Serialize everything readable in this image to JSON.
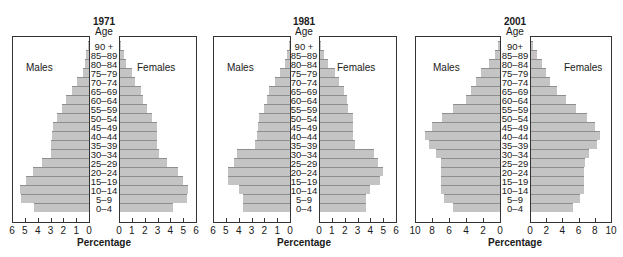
{
  "chart_data": [
    {
      "type": "bar",
      "subtype": "population-pyramid",
      "title": "1971",
      "age_header": "Age",
      "categories": [
        "0–4",
        "5–9",
        "10–14",
        "15–19",
        "20–24",
        "25–29",
        "30–34",
        "35–39",
        "40–44",
        "45–49",
        "50–54",
        "55–59",
        "60–64",
        "65–69",
        "70–74",
        "75–79",
        "80–84",
        "85–89",
        "90 +"
      ],
      "series": [
        {
          "name": "Males",
          "values": [
            4.3,
            5.3,
            5.4,
            4.9,
            4.4,
            3.7,
            3.0,
            3.0,
            2.9,
            2.8,
            2.5,
            2.1,
            1.8,
            1.3,
            0.9,
            0.5,
            0.3,
            0.2,
            0.05
          ]
        },
        {
          "name": "Females",
          "values": [
            4.1,
            5.2,
            5.3,
            4.9,
            4.5,
            3.7,
            3.0,
            2.9,
            2.9,
            2.9,
            2.5,
            2.1,
            1.8,
            1.6,
            1.2,
            0.9,
            0.5,
            0.3,
            0.1
          ]
        }
      ],
      "xlabel": "Percentage",
      "xlim": [
        0,
        6
      ],
      "ticks": [
        "0",
        "1",
        "2",
        "3",
        "4",
        "5",
        "6"
      ],
      "grid": false
    },
    {
      "type": "bar",
      "subtype": "population-pyramid",
      "title": "1981",
      "age_header": "Age",
      "categories": [
        "0–4",
        "5–9",
        "10–14",
        "15–19",
        "20–24",
        "25–29",
        "30–34",
        "35–39",
        "40–44",
        "45–49",
        "50–54",
        "55–59",
        "60–64",
        "65–69",
        "70–74",
        "75–79",
        "80–84",
        "85–89",
        "90 +"
      ],
      "series": [
        {
          "name": "Males",
          "values": [
            3.7,
            3.7,
            4.0,
            4.8,
            4.8,
            4.4,
            4.1,
            2.7,
            2.6,
            2.5,
            2.4,
            2.0,
            1.8,
            1.6,
            1.2,
            0.8,
            0.4,
            0.2,
            0.05
          ]
        },
        {
          "name": "Females",
          "values": [
            3.6,
            3.6,
            3.9,
            4.7,
            4.9,
            4.5,
            4.2,
            2.7,
            2.6,
            2.6,
            2.6,
            2.2,
            2.1,
            1.9,
            1.5,
            1.2,
            0.6,
            0.3,
            0.1
          ]
        }
      ],
      "xlabel": "Percentage",
      "xlim": [
        0,
        6
      ],
      "ticks": [
        "0",
        "1",
        "2",
        "3",
        "4",
        "5",
        "6"
      ],
      "grid": false
    },
    {
      "type": "bar",
      "subtype": "population-pyramid",
      "title": "2001",
      "age_header": "Age",
      "categories": [
        "0–4",
        "5–9",
        "10–14",
        "15–19",
        "20–24",
        "25–29",
        "30–34",
        "35–39",
        "40–44",
        "45–49",
        "50–54",
        "55–59",
        "60–64",
        "65–69",
        "70–74",
        "75–79",
        "80–84",
        "85–89",
        "90+"
      ],
      "series": [
        {
          "name": "Males",
          "values": [
            5.5,
            6.6,
            7.0,
            6.9,
            7.0,
            6.9,
            7.5,
            8.4,
            8.8,
            8.0,
            6.8,
            5.5,
            4.0,
            3.4,
            2.8,
            2.2,
            1.3,
            0.6,
            0.2
          ]
        },
        {
          "name": "Females",
          "values": [
            5.2,
            6.1,
            6.6,
            6.6,
            6.5,
            6.7,
            7.2,
            8.1,
            8.5,
            7.9,
            6.9,
            5.6,
            4.3,
            3.2,
            2.4,
            1.9,
            1.3,
            0.7,
            0.3
          ]
        }
      ],
      "xlabel": "Percentage",
      "xlim": [
        0,
        10
      ],
      "ticks": [
        "0",
        "2",
        "4",
        "6",
        "8",
        "10"
      ],
      "grid": false
    }
  ],
  "labels": {
    "males": "Males",
    "females": "Females"
  },
  "colors": {
    "bar_fill": "#c4c4c4",
    "bar_edge": "#8e8e8e",
    "frame": "#333333"
  }
}
